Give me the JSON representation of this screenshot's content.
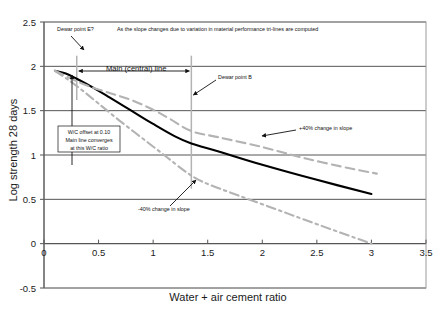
{
  "chart_data": {
    "type": "line",
    "title": "",
    "xlabel": "Water + air cement ratio",
    "ylabel": "Log strength 28 days",
    "xlim": [
      0,
      3.5
    ],
    "ylim": [
      -0.5,
      2.5
    ],
    "xticks": [
      "0",
      "0.5",
      "1",
      "1.5",
      "2",
      "2.5",
      "3",
      "3.5"
    ],
    "xtick_values": [
      0,
      0.5,
      1,
      1.5,
      2,
      2.5,
      3,
      3.5
    ],
    "yticks": [
      "2.5",
      "2",
      "1.5",
      "1",
      "0.5",
      "0",
      "-0.5"
    ],
    "ytick_values": [
      2.5,
      2,
      1.5,
      1,
      0.5,
      0,
      -0.5
    ],
    "grid": "horizontal",
    "legend": "none",
    "series": [
      {
        "name": "Main (central) line",
        "style": "solid",
        "color": "#000000",
        "width": 2.1,
        "points": [
          [
            0.1,
            1.95
          ],
          [
            0.2,
            1.92
          ],
          [
            0.3,
            1.86
          ],
          [
            0.45,
            1.76
          ],
          [
            0.6,
            1.65
          ],
          [
            0.8,
            1.5
          ],
          [
            1.0,
            1.35
          ],
          [
            1.2,
            1.21
          ],
          [
            1.35,
            1.13
          ],
          [
            1.6,
            1.04
          ],
          [
            2.0,
            0.89
          ],
          [
            2.5,
            0.72
          ],
          [
            3.0,
            0.56
          ]
        ]
      },
      {
        "name": "+40% change in slope",
        "style": "dashed",
        "color": "#b3b3b3",
        "width": 2.1,
        "points": [
          [
            0.1,
            1.95
          ],
          [
            0.25,
            1.86
          ],
          [
            0.4,
            1.78
          ],
          [
            0.6,
            1.7
          ],
          [
            0.8,
            1.62
          ],
          [
            1.0,
            1.51
          ],
          [
            1.15,
            1.41
          ],
          [
            1.35,
            1.27
          ],
          [
            1.6,
            1.2
          ],
          [
            2.0,
            1.09
          ],
          [
            2.4,
            0.96
          ],
          [
            2.8,
            0.85
          ],
          [
            3.05,
            0.79
          ]
        ]
      },
      {
        "name": "-40% change in slope",
        "style": "dashdot",
        "color": "#b3b3b3",
        "width": 2.1,
        "points": [
          [
            0.1,
            1.95
          ],
          [
            0.22,
            1.85
          ],
          [
            0.35,
            1.73
          ],
          [
            0.5,
            1.58
          ],
          [
            0.7,
            1.38
          ],
          [
            0.9,
            1.19
          ],
          [
            1.1,
            1.0
          ],
          [
            1.3,
            0.81
          ],
          [
            1.45,
            0.7
          ],
          [
            1.7,
            0.58
          ],
          [
            2.1,
            0.4
          ],
          [
            2.5,
            0.22
          ],
          [
            3.0,
            0.0
          ]
        ]
      }
    ],
    "markers": [
      {
        "name": "dewar-point-e-marker",
        "x": 0.3,
        "y_top": 2.12,
        "y_bottom": 1.62,
        "color": "#b3b3b3"
      },
      {
        "name": "dewar-point-b-marker",
        "x": 1.35,
        "y_top": 2.12,
        "y_bottom": 0.62,
        "color": "#b3b3b3"
      }
    ],
    "annotations": [
      {
        "name": "dewar-point-e-label",
        "text": "Dewar point E?",
        "x_px": 57,
        "y_px": 31
      },
      {
        "name": "tri-lines-note",
        "text": "As the slope changes due to variation in material performance tri-lines are computed",
        "x_px": 117,
        "y_px": 31
      },
      {
        "name": "main-central-line-label",
        "text": "Main (central) line",
        "x_px": 106,
        "y_px": 71
      },
      {
        "name": "dewar-point-b-label",
        "text": "Dewar point B",
        "x_px": 218,
        "y_px": 79
      },
      {
        "name": "plus-40-label",
        "text": "+40% change in slope",
        "x_px": 299,
        "y_px": 130
      },
      {
        "name": "minus-40-label",
        "text": "-40% change in slope",
        "x_px": 138,
        "y_px": 211
      }
    ],
    "callout_box": {
      "name": "wc-offset-box",
      "lines": [
        "W/C offset at 0.10",
        "Main line converges",
        "at this W/C ratio"
      ]
    }
  },
  "colors": {
    "plot_border": "#9a9a9a",
    "gridline": "#555555",
    "axis_line": "#555555",
    "main_line": "#000000",
    "tri_line": "#b3b3b3",
    "text": "#111111",
    "background": "#ffffff"
  }
}
